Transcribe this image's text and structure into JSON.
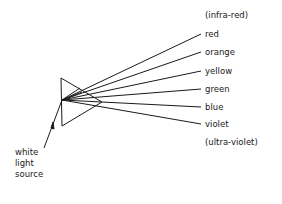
{
  "diagram": {
    "source_label": [
      "white",
      "light",
      "source"
    ],
    "spectrum_labels": {
      "top_extra": "(infra-red)",
      "colors": [
        "red",
        "orange",
        "yellow",
        "green",
        "blue",
        "violet"
      ],
      "bottom_extra": "(ultra-violet)"
    },
    "line_color": "#1a1a1a"
  }
}
